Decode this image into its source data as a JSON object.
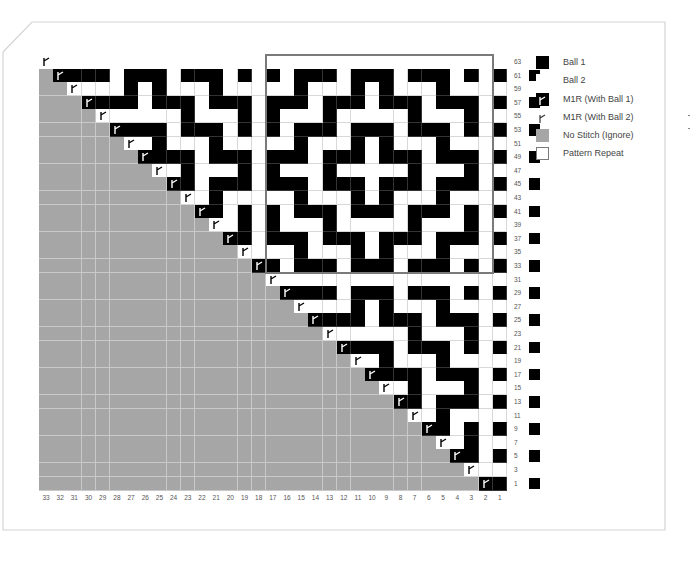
{
  "chart_data": {
    "type": "knitting-chart",
    "title": "",
    "columns": 33,
    "rows_shown": [
      63,
      61,
      59,
      57,
      55,
      53,
      51,
      49,
      47,
      45,
      43,
      41,
      39,
      37,
      35,
      33,
      31,
      29,
      27,
      25,
      23,
      21,
      19,
      17,
      15,
      13,
      11,
      9,
      7,
      5,
      3,
      1
    ],
    "column_labels": [
      "33",
      "32",
      "31",
      "30",
      "29",
      "28",
      "27",
      "26",
      "25",
      "24",
      "23",
      "22",
      "21",
      "20",
      "19",
      "18",
      "17",
      "16",
      "15",
      "14",
      "13",
      "12",
      "11",
      "10",
      "9",
      "8",
      "7",
      "6",
      "5",
      "4",
      "3",
      "2",
      "1"
    ],
    "pattern_repeat": {
      "columns": [
        17,
        2
      ],
      "rows": [
        63,
        33
      ],
      "rows_cols17_to_2": {
        "63": "0000000000000000",
        "61": "1011101110111010",
        "59": "0010001010001000",
        "57": "1110111011101110",
        "55": "1000100000100010",
        "53": "1011101110111010",
        "51": "0010001010001000",
        "49": "1110111011101110",
        "47": "1000100000100010",
        "45": "1110111011101110",
        "43": "0010001010001000",
        "41": "1011101110111010",
        "39": "1000100000100010",
        "37": "1110111011101110",
        "35": "0010001010001000",
        "33": "1011101110111010"
      }
    },
    "grid_rows": [
      "MW00000000000000000000000000000000",
      "GMB1110111011101110111011101010"
    ]
  },
  "legend": {
    "items": [
      {
        "key": "ball1",
        "label": "Ball 1",
        "swatch": "#000000"
      },
      {
        "key": "ball2",
        "label": "Ball 2",
        "swatch": "#ffffff"
      },
      {
        "key": "m1r-ball1",
        "label": "M1R (With Ball 1)",
        "swatch": "#000000"
      },
      {
        "key": "m1r-ball2",
        "label": "M1R (With Ball 2)",
        "swatch": "#ffffff"
      },
      {
        "key": "no-stitch",
        "label": "No Stitch (Ignore)",
        "swatch": "#a6a6a6"
      },
      {
        "key": "pattern-repeat",
        "label": "Pattern Repeat",
        "swatch": "outline"
      }
    ]
  },
  "colors": {
    "ball1": "#000000",
    "ball2": "#ffffff",
    "no_stitch": "#a6a6a6",
    "repeat_box": "#7a7a7a",
    "frame": "#d0d0d0"
  }
}
